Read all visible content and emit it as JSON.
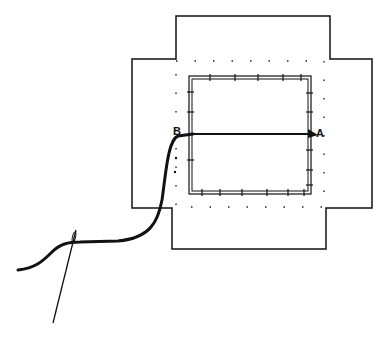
{
  "diagram": {
    "type": "sewing-illustration",
    "labels": {
      "point_b": "B",
      "point_a": "A"
    },
    "colors": {
      "ink": "#111111",
      "background": "#ffffff"
    },
    "parts": [
      "cross-shaped fabric",
      "basted inner square",
      "stitch line B to A",
      "thread",
      "needle"
    ]
  }
}
